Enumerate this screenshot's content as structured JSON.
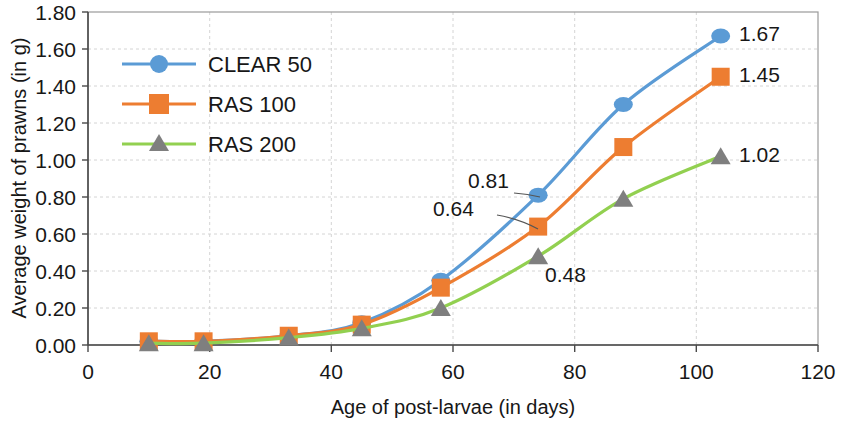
{
  "chart_data": {
    "type": "line",
    "title": "",
    "xlabel": "Age of post-larvae (in days)",
    "ylabel": "Average weight of prawns (in g)",
    "xlim": [
      0,
      120
    ],
    "ylim": [
      0.0,
      1.8
    ],
    "x_ticks": [
      "0",
      "20",
      "40",
      "60",
      "80",
      "100",
      "120"
    ],
    "y_ticks": [
      "0.00",
      "0.20",
      "0.40",
      "0.60",
      "0.80",
      "1.00",
      "1.20",
      "1.40",
      "1.60",
      "1.80"
    ],
    "x": [
      10,
      19,
      33,
      45,
      58,
      74,
      88,
      104
    ],
    "grid": true,
    "legend_position": "upper-left",
    "series": [
      {
        "name": "CLEAR 50",
        "marker": "circle",
        "line_color": "#5B9BD5",
        "marker_color": "#5B9BD5",
        "values": [
          0.02,
          0.02,
          0.05,
          0.12,
          0.35,
          0.81,
          1.3,
          1.67
        ]
      },
      {
        "name": "RAS 100",
        "marker": "square",
        "line_color": "#ED7D31",
        "marker_color": "#ED7D31",
        "values": [
          0.02,
          0.02,
          0.05,
          0.11,
          0.31,
          0.64,
          1.07,
          1.45
        ]
      },
      {
        "name": "RAS 200",
        "marker": "triangle",
        "line_color": "#92D050",
        "marker_color": "#7F7F7F",
        "values": [
          0.01,
          0.01,
          0.04,
          0.09,
          0.2,
          0.48,
          0.79,
          1.02
        ]
      }
    ],
    "annotations": [
      {
        "text": "1.67",
        "series": "CLEAR 50",
        "x": 104,
        "y": 1.67,
        "leader": false
      },
      {
        "text": "1.45",
        "series": "RAS 100",
        "x": 104,
        "y": 1.45,
        "leader": false
      },
      {
        "text": "1.02",
        "series": "RAS 200",
        "x": 104,
        "y": 1.02,
        "leader": false
      },
      {
        "text": "0.81",
        "series": "CLEAR 50",
        "x": 74,
        "y": 0.81,
        "leader": true
      },
      {
        "text": "0.64",
        "series": "RAS 100",
        "x": 74,
        "y": 0.64,
        "leader": true
      },
      {
        "text": "0.48",
        "series": "RAS 200",
        "x": 74,
        "y": 0.48,
        "leader": false
      }
    ]
  },
  "axes": {
    "x_title": "Age of post-larvae (in days)",
    "y_title": "Average weight of prawns (in g)",
    "x_tick_labels": [
      "0",
      "20",
      "40",
      "60",
      "80",
      "100",
      "120"
    ],
    "y_tick_labels": [
      "1.80",
      "1.60",
      "1.40",
      "1.20",
      "1.00",
      "0.80",
      "0.60",
      "0.40",
      "0.20",
      "0.00"
    ]
  },
  "legend": {
    "items": [
      {
        "label": "CLEAR 50"
      },
      {
        "label": "RAS 100"
      },
      {
        "label": "RAS 200"
      }
    ]
  },
  "labels": {
    "p1": "1.67",
    "p2": "1.45",
    "p3": "1.02",
    "p4": "0.81",
    "p5": "0.64",
    "p6": "0.48"
  }
}
